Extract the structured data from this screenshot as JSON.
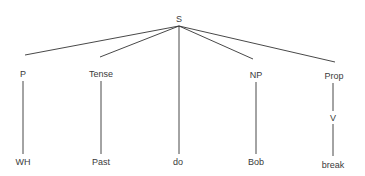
{
  "tree": {
    "root": {
      "id": "S",
      "label": "S",
      "x": 179,
      "y": 19
    },
    "nodes": [
      {
        "id": "P",
        "label": "P",
        "x": 23,
        "y": 74
      },
      {
        "id": "Tense",
        "label": "Tense",
        "x": 101,
        "y": 74
      },
      {
        "id": "NP",
        "label": "NP",
        "x": 256,
        "y": 75
      },
      {
        "id": "Prop",
        "label": "Prop",
        "x": 334,
        "y": 76
      },
      {
        "id": "V",
        "label": "V",
        "x": 333,
        "y": 118
      },
      {
        "id": "WH",
        "label": "WH",
        "x": 23,
        "y": 162
      },
      {
        "id": "Past",
        "label": "Past",
        "x": 101,
        "y": 162
      },
      {
        "id": "do",
        "label": "do",
        "x": 178,
        "y": 162
      },
      {
        "id": "Bob",
        "label": "Bob",
        "x": 256,
        "y": 162
      },
      {
        "id": "break",
        "label": "break",
        "x": 333,
        "y": 165
      }
    ],
    "edges": [
      {
        "from": "S",
        "to": "P",
        "x1": 179,
        "y1": 26,
        "x2": 25,
        "y2": 55
      },
      {
        "from": "S",
        "to": "Tense",
        "x1": 179,
        "y1": 26,
        "x2": 100,
        "y2": 57
      },
      {
        "from": "S",
        "to": "do",
        "x1": 179,
        "y1": 26,
        "x2": 179,
        "y2": 154
      },
      {
        "from": "S",
        "to": "NP",
        "x1": 179,
        "y1": 26,
        "x2": 253,
        "y2": 59
      },
      {
        "from": "S",
        "to": "Prop",
        "x1": 179,
        "y1": 26,
        "x2": 335,
        "y2": 62
      },
      {
        "from": "P",
        "to": "WH",
        "x1": 23,
        "y1": 81,
        "x2": 23,
        "y2": 154
      },
      {
        "from": "Tense",
        "to": "Past",
        "x1": 101,
        "y1": 81,
        "x2": 101,
        "y2": 154
      },
      {
        "from": "NP",
        "to": "Bob",
        "x1": 256,
        "y1": 82,
        "x2": 256,
        "y2": 154
      },
      {
        "from": "Prop",
        "to": "V",
        "x1": 333,
        "y1": 83,
        "x2": 333,
        "y2": 111
      },
      {
        "from": "V",
        "to": "break",
        "x1": 333,
        "y1": 124,
        "x2": 333,
        "y2": 156
      }
    ],
    "line_color": "#333333"
  }
}
